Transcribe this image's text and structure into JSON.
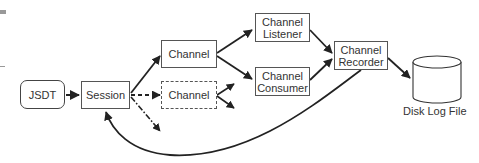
{
  "diagram": {
    "nodes": {
      "jsdt": {
        "label": "JSDT",
        "shape": "rounded-rect"
      },
      "session": {
        "label": "Session",
        "shape": "rect"
      },
      "channel": {
        "label": "Channel",
        "shape": "rect"
      },
      "channel_dashed": {
        "label": "Channel",
        "shape": "dashed-rect"
      },
      "channel_listener": {
        "label_line1": "Channel",
        "label_line2": "Listener",
        "shape": "rect"
      },
      "channel_consumer": {
        "label_line1": "Channel",
        "label_line2": "Consumer",
        "shape": "rect"
      },
      "channel_recorder": {
        "label_line1": "Channel",
        "label_line2": "Recorder",
        "shape": "rect"
      },
      "disk_log_file": {
        "label": "Disk Log File",
        "shape": "cylinder"
      }
    },
    "edges": [
      {
        "from": "JSDT",
        "to": "Session",
        "style": "solid"
      },
      {
        "from": "Session",
        "to": "Channel",
        "style": "solid"
      },
      {
        "from": "Session",
        "to": "Channel (dashed)",
        "style": "dashed"
      },
      {
        "from": "Session",
        "to": "(unlabeled)",
        "style": "dash-dot"
      },
      {
        "from": "Channel",
        "to": "Channel Listener",
        "style": "solid"
      },
      {
        "from": "Channel",
        "to": "Channel Consumer",
        "style": "solid"
      },
      {
        "from": "Channel (dashed)",
        "to": "(unlabeled)",
        "style": "solid"
      },
      {
        "from": "Channel (dashed)",
        "to": "(unlabeled)",
        "style": "solid"
      },
      {
        "from": "Channel Listener",
        "to": "Channel Recorder",
        "style": "solid"
      },
      {
        "from": "Channel Consumer",
        "to": "Channel Recorder",
        "style": "solid"
      },
      {
        "from": "Channel Recorder",
        "to": "Disk Log File",
        "style": "solid"
      },
      {
        "from": "Channel Recorder",
        "to": "Session",
        "style": "solid-curved"
      }
    ],
    "colors": {
      "stroke": "#222222",
      "box_border": "#555555",
      "text": "#333333",
      "background": "#ffffff"
    }
  }
}
